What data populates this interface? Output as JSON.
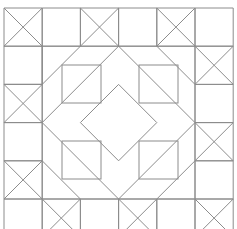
{
  "diagram": {
    "type": "geometric-quilt-pattern",
    "stroke_color": "#8c8c8c",
    "background_color": "#ffffff",
    "grid": {
      "origin": [
        4,
        8
      ],
      "cell_size": 38.2,
      "columns": 6,
      "rows": 6
    },
    "x_cells": [
      [
        0,
        0
      ],
      [
        2,
        0
      ],
      [
        4,
        0
      ],
      [
        5,
        1
      ],
      [
        0,
        2
      ],
      [
        5,
        3
      ],
      [
        0,
        4
      ],
      [
        1,
        5
      ],
      [
        3,
        5
      ],
      [
        5,
        5
      ]
    ],
    "single_diagonals": [
      {
        "from": [
          1,
          2
        ],
        "to": [
          2,
          1
        ]
      },
      {
        "from": [
          1,
          1
        ],
        "to": [
          2,
          2
        ]
      },
      {
        "from": [
          2,
          1
        ],
        "to": [
          3,
          2
        ]
      },
      {
        "from": [
          3,
          1
        ],
        "to": [
          2,
          2
        ]
      },
      {
        "from": [
          3,
          1
        ],
        "to": [
          4,
          2
        ]
      },
      {
        "from": [
          4,
          1
        ],
        "to": [
          3,
          2
        ]
      },
      {
        "from": [
          4,
          1
        ],
        "to": [
          5,
          2
        ]
      },
      {
        "from": [
          5,
          2
        ],
        "to": [
          4,
          3
        ]
      },
      {
        "from": [
          4,
          3
        ],
        "to": [
          5,
          4
        ]
      },
      {
        "from": [
          5,
          4
        ],
        "to": [
          4,
          5
        ]
      },
      {
        "from": [
          4,
          5
        ],
        "to": [
          3,
          4
        ]
      },
      {
        "from": [
          3,
          4
        ],
        "to": [
          4,
          3
        ]
      },
      {
        "from": [
          3,
          5
        ],
        "to": [
          2,
          4
        ]
      },
      {
        "from": [
          2,
          5
        ],
        "to": [
          3,
          4
        ]
      },
      {
        "from": [
          2,
          5
        ],
        "to": [
          1,
          4
        ]
      },
      {
        "from": [
          1,
          5
        ],
        "to": [
          2,
          4
        ]
      },
      {
        "from": [
          1,
          4
        ],
        "to": [
          2,
          3
        ]
      },
      {
        "from": [
          1,
          4
        ],
        "to": [
          0,
          5
        ]
      },
      {
        "from": [
          1,
          3
        ],
        "to": [
          2,
          4
        ]
      },
      {
        "from": [
          1,
          2
        ],
        "to": [
          2,
          3
        ]
      },
      {
        "from": [
          1,
          3
        ],
        "to": [
          0,
          4
        ]
      },
      {
        "from": [
          1,
          3
        ],
        "to": [
          2,
          2
        ]
      },
      {
        "from": [
          3,
          2
        ],
        "to": [
          4,
          3
        ]
      },
      {
        "from": [
          2,
          3
        ],
        "to": [
          3,
          2
        ]
      },
      {
        "from": [
          2,
          3
        ],
        "to": [
          3,
          4
        ]
      }
    ],
    "inset_squares": [
      {
        "x": 62,
        "y": 65,
        "w": 39,
        "h": 38
      },
      {
        "x": 139,
        "y": 65,
        "w": 39,
        "h": 38
      },
      {
        "x": 62,
        "y": 141,
        "w": 39,
        "h": 38
      },
      {
        "x": 139,
        "y": 141,
        "w": 39,
        "h": 38
      }
    ]
  }
}
